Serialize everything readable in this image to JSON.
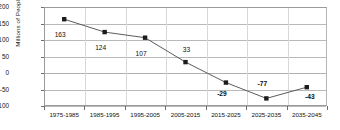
{
  "chart_data": {
    "type": "line",
    "title": "",
    "xlabel": "",
    "ylabel": "Millions of People",
    "categories": [
      "1975-1985",
      "1985-1995",
      "1995-2005",
      "2005-2015",
      "2015-2025",
      "2025-2035",
      "2035-2045"
    ],
    "values": [
      163,
      124,
      107,
      33,
      -29,
      -77,
      -43
    ],
    "point_labels": [
      "163",
      "124",
      "107",
      "33",
      "-29",
      "-77",
      "-43"
    ],
    "ylim": [
      -100,
      200
    ],
    "ytick_values": [
      200,
      150,
      100,
      50,
      0,
      -50,
      -100
    ],
    "ytick_labels": [
      "200",
      "150",
      "100",
      "50",
      "0",
      "-50",
      "-100"
    ],
    "grid": "horizontal",
    "legend": "none",
    "marker": "square",
    "marker_color": "#1c1c1c",
    "line_color": "#4a4a4a"
  },
  "axis": {
    "y_title": "Millions of People"
  }
}
